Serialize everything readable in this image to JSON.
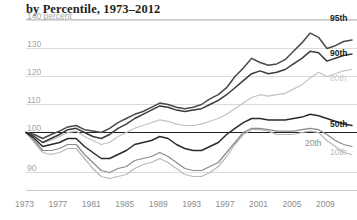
{
  "chart_title": "by Percentile, 1973–2012",
  "chart_data": {
    "type": "line",
    "title": "by Percentile, 1973–2012",
    "xlabel": "",
    "ylabel": "140 percent",
    "yunit_label": "140 percent",
    "xlim": [
      1973,
      2012
    ],
    "ylim": [
      85,
      141
    ],
    "grid": true,
    "gridlines": [
      140,
      130,
      120,
      110,
      100,
      90
    ],
    "baseline": 100,
    "legend_position": "right-inline",
    "ytick_labels": [
      "140 percent",
      "130",
      "120",
      "110",
      "100",
      "90"
    ],
    "ytick_values": [
      140,
      130,
      120,
      110,
      100,
      90
    ],
    "xtick_labels": [
      "1973",
      "1977",
      "1981",
      "1985",
      "1989",
      "1993",
      "1997",
      "2001",
      "2005",
      "2009"
    ],
    "xtick_values": [
      1973,
      1977,
      1981,
      1985,
      1989,
      1993,
      1997,
      2001,
      2005,
      2009
    ],
    "x": [
      1973,
      1974,
      1975,
      1976,
      1977,
      1978,
      1979,
      1980,
      1981,
      1982,
      1983,
      1984,
      1985,
      1986,
      1987,
      1988,
      1989,
      1990,
      1991,
      1992,
      1993,
      1994,
      1995,
      1996,
      1997,
      1998,
      1999,
      2000,
      2001,
      2002,
      2003,
      2004,
      2005,
      2006,
      2007,
      2008,
      2009,
      2010,
      2011,
      2012
    ],
    "series": [
      {
        "name": "95th",
        "label": "95th",
        "color": "#4a4a4a",
        "label_color": "#231f20",
        "values": [
          100,
          99.5,
          98.5,
          99.5,
          100.5,
          102,
          102.5,
          101,
          100.5,
          100,
          101.5,
          103.5,
          105,
          106.5,
          107.5,
          109,
          110.5,
          110,
          109,
          108.5,
          109,
          110,
          112,
          113.5,
          116,
          120,
          123,
          126.5,
          125,
          124,
          124.5,
          126,
          129,
          132,
          135.5,
          134,
          130,
          131,
          132.5,
          133
        ]
      },
      {
        "name": "90th",
        "label": "90th",
        "color": "#3a3a3a",
        "label_color": "#231f20",
        "values": [
          100,
          99,
          97.5,
          98.5,
          99.5,
          101,
          101.5,
          100,
          99,
          98.5,
          99.5,
          101.5,
          103,
          105,
          106.5,
          108,
          109.5,
          109,
          108,
          107.5,
          108,
          108.5,
          110,
          111.5,
          113.5,
          116,
          118.5,
          121,
          122,
          121,
          121.5,
          122.5,
          124.5,
          126.5,
          129,
          128.5,
          125.5,
          126.5,
          127.5,
          128
        ]
      },
      {
        "name": "80th",
        "label": "80th",
        "color": "#c2c2c2",
        "label_color": "#cacaca",
        "values": [
          100,
          99,
          97.5,
          98,
          99,
          100,
          100.5,
          99,
          98,
          97,
          97.5,
          99,
          100,
          101.5,
          102.5,
          103.5,
          104.5,
          104,
          103,
          102.5,
          102.5,
          103,
          104,
          105,
          106.5,
          108.5,
          110.5,
          112.5,
          113.5,
          113,
          113.5,
          114,
          115.5,
          117,
          119.5,
          121.5,
          120,
          121,
          122,
          122.5
        ]
      },
      {
        "name": "50th",
        "label": "50th",
        "color": "#2b2b2b",
        "label_color": "#231f20",
        "values": [
          100,
          98.5,
          96.5,
          97,
          97.5,
          98.5,
          98.5,
          96.5,
          95,
          93.5,
          93.5,
          94.5,
          95.5,
          97,
          97.5,
          98,
          99,
          98.5,
          97,
          96,
          95.5,
          95.5,
          96.5,
          97.5,
          99.5,
          101.5,
          103.5,
          105,
          105,
          104.5,
          104.5,
          104.5,
          105,
          105.5,
          106.5,
          106,
          105,
          104,
          103,
          102.5
        ]
      },
      {
        "name": "20th",
        "label": "20th",
        "color": "#8a8a8a",
        "label_color": "#8d8d8d",
        "values": [
          100,
          98,
          95.5,
          95.5,
          96,
          97,
          97,
          94.5,
          92.5,
          90.5,
          90,
          91,
          91.5,
          93,
          93.5,
          94,
          95,
          94,
          92.5,
          91,
          90.5,
          90.5,
          91.5,
          92.5,
          95,
          97.5,
          100,
          101.5,
          101.5,
          101,
          100.5,
          100.5,
          100.5,
          101,
          101.5,
          101,
          99.5,
          98,
          97,
          96.5
        ]
      },
      {
        "name": "10th",
        "label": "10th",
        "color": "#b9b9b9",
        "label_color": "#b9b9b9",
        "values": [
          100,
          97.5,
          95,
          94.5,
          95,
          96,
          96,
          93.5,
          91,
          89,
          88.5,
          89,
          89.5,
          91,
          92,
          92.5,
          93.5,
          92.5,
          91,
          89.5,
          89,
          89,
          90,
          91.5,
          94,
          97,
          99.5,
          101,
          101,
          100.5,
          99.5,
          99.5,
          99.5,
          100,
          100.5,
          100,
          98,
          96.5,
          95,
          94.5
        ]
      }
    ]
  }
}
